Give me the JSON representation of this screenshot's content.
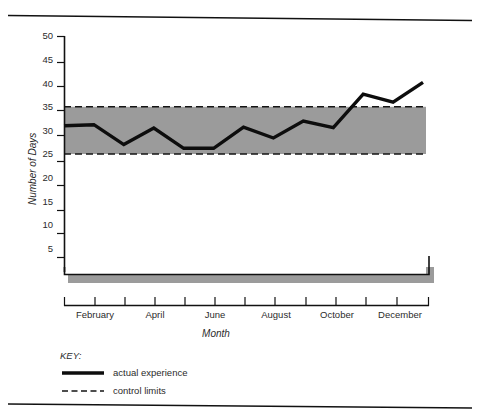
{
  "figure": {
    "top_rule": "horizontal-rule",
    "bottom_rule": "horizontal-rule"
  },
  "chart_data": {
    "type": "line",
    "title": "",
    "subtitle": "",
    "xlabel": "Month",
    "ylabel": "Number of Days",
    "ylim": [
      0,
      50
    ],
    "yticks": [
      5,
      10,
      15,
      20,
      25,
      30,
      35,
      40,
      45,
      50
    ],
    "ytick_labels": [
      "5",
      "10",
      "15",
      "20",
      "25",
      "30",
      "35",
      "40",
      "45",
      "50"
    ],
    "grid": false,
    "legend_position": "below-axes",
    "x": [
      1,
      2,
      3,
      4,
      5,
      6,
      7,
      8,
      9,
      10,
      11,
      12,
      13
    ],
    "categories": [
      "January",
      "February",
      "March",
      "April",
      "May",
      "June",
      "July",
      "August",
      "September",
      "October",
      "November",
      "December",
      "January"
    ],
    "xtick_labels": [
      "",
      "February",
      "",
      "April",
      "",
      "June",
      "",
      "August",
      "",
      "October",
      "",
      "December",
      ""
    ],
    "series": [
      {
        "name": "actual experience",
        "style": "solid",
        "values": [
          31,
          31.2,
          27,
          30.5,
          26.2,
          26.2,
          30.7,
          28.4,
          32,
          30.6,
          37.7,
          36,
          40.2
        ]
      }
    ],
    "control_limits": {
      "name": "control limits",
      "style": "dashed",
      "upper": 35,
      "lower": 25,
      "band_fill": "#9b9b9b"
    },
    "annotations": []
  },
  "axes": {
    "y_axis_label": "Number of Days",
    "x_axis_label": "Month"
  },
  "legend": {
    "title": "KEY:",
    "entries": [
      {
        "label": "actual experience",
        "marker": "solid-line"
      },
      {
        "label": "control limits",
        "marker": "dashed-line"
      }
    ]
  },
  "colors": {
    "band": "#9b9b9b",
    "line": "#0d0d0d",
    "limits": "#151515",
    "axis": "#111111",
    "text": "#2b2b2b",
    "background": "#ffffff"
  }
}
